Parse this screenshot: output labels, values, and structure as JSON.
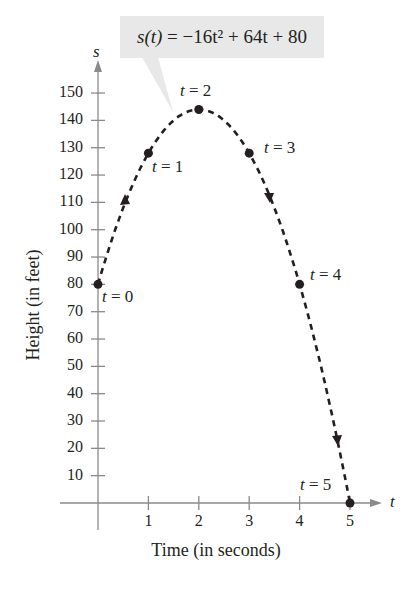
{
  "chart_data": {
    "type": "line",
    "title": "",
    "equation": "s(t) = −16t² + 64t + 80",
    "equation_parts": {
      "lhs": "s(t)",
      "rhs": "= −16t² + 64t + 80"
    },
    "xlabel": "Time (in seconds)",
    "ylabel": "Height (in feet)",
    "x_axis_symbol": "t",
    "y_axis_symbol": "s",
    "xlim": [
      0,
      5
    ],
    "ylim": [
      0,
      150
    ],
    "x_ticks": [
      1,
      2,
      3,
      4,
      5
    ],
    "y_ticks": [
      10,
      20,
      30,
      40,
      50,
      60,
      70,
      80,
      90,
      100,
      110,
      120,
      130,
      140,
      150
    ],
    "grid": false,
    "line_style": "dashed",
    "series": [
      {
        "name": "s(t)",
        "x": [
          0,
          1,
          2,
          3,
          4,
          5
        ],
        "values": [
          80,
          128,
          144,
          128,
          80,
          0
        ]
      }
    ],
    "annotations": [
      {
        "text": "t = 0",
        "x": 0,
        "y": 80
      },
      {
        "text": "t = 1",
        "x": 1,
        "y": 128
      },
      {
        "text": "t = 2",
        "x": 2,
        "y": 144
      },
      {
        "text": "t = 3",
        "x": 3,
        "y": 128
      },
      {
        "text": "t = 4",
        "x": 4,
        "y": 80
      },
      {
        "text": "t = 5",
        "x": 5,
        "y": 0
      }
    ],
    "colors": {
      "line": "#231f20",
      "axis": "#8a8a8a",
      "callout_bg": "#e8e8e8"
    }
  },
  "labels": {
    "t0": "t = 0",
    "t1": "t = 1",
    "t2": "t = 2",
    "t3": "t = 3",
    "t4": "t = 4",
    "t5": "t = 5"
  }
}
